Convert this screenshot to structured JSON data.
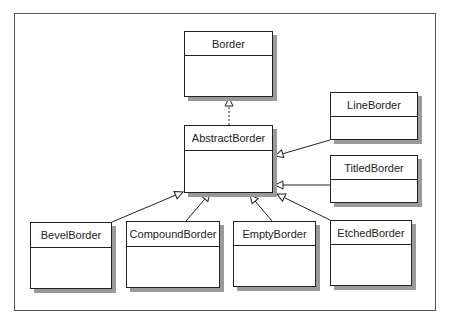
{
  "diagram": {
    "type": "uml-class-hierarchy",
    "classes": [
      {
        "id": "border",
        "name": "Border",
        "x": 184,
        "y": 31,
        "w": 89,
        "h": 66,
        "header_h": 23
      },
      {
        "id": "abstract",
        "name": "AbstractBorder",
        "x": 184,
        "y": 125,
        "w": 89,
        "h": 68,
        "header_h": 24
      },
      {
        "id": "line",
        "name": "LineBorder",
        "x": 330,
        "y": 92,
        "w": 88,
        "h": 48,
        "header_h": 23
      },
      {
        "id": "titled",
        "name": "TitledBorder",
        "x": 330,
        "y": 155,
        "w": 88,
        "h": 48,
        "header_h": 23
      },
      {
        "id": "bevel",
        "name": "BevelBorder",
        "x": 30,
        "y": 222,
        "w": 82,
        "h": 67,
        "header_h": 24
      },
      {
        "id": "compound",
        "name": "CompoundBorder",
        "x": 126,
        "y": 221,
        "w": 94,
        "h": 67,
        "header_h": 24
      },
      {
        "id": "empty",
        "name": "EmptyBorder",
        "x": 233,
        "y": 221,
        "w": 83,
        "h": 66,
        "header_h": 23
      },
      {
        "id": "etched",
        "name": "EtchedBorder",
        "x": 330,
        "y": 220,
        "w": 82,
        "h": 66,
        "header_h": 23
      }
    ],
    "relations": [
      {
        "from": "AbstractBorder",
        "to": "Border",
        "kind": "realization"
      },
      {
        "from": "LineBorder",
        "to": "AbstractBorder",
        "kind": "generalization"
      },
      {
        "from": "TitledBorder",
        "to": "AbstractBorder",
        "kind": "generalization"
      },
      {
        "from": "BevelBorder",
        "to": "AbstractBorder",
        "kind": "generalization"
      },
      {
        "from": "CompoundBorder",
        "to": "AbstractBorder",
        "kind": "generalization"
      },
      {
        "from": "EmptyBorder",
        "to": "AbstractBorder",
        "kind": "generalization"
      },
      {
        "from": "EtchedBorder",
        "to": "AbstractBorder",
        "kind": "generalization"
      }
    ]
  }
}
